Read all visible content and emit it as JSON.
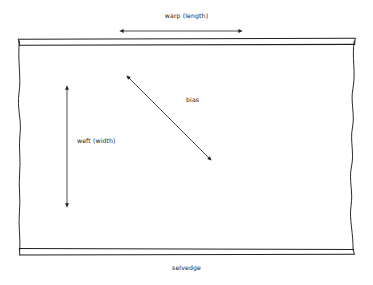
{
  "diagram": {
    "background_color": "#ffffff",
    "line_color": "#231f20",
    "labels": {
      "warp": "warp (length)",
      "weft": "weft (width)",
      "bias": "bias",
      "selvedge": "selvedge"
    },
    "annotations": [
      {
        "name": "warp-arrow",
        "label": "warp (length)",
        "orientation": "horizontal",
        "double_headed": true,
        "from": [
          122,
          31
        ],
        "to": [
          240,
          31
        ]
      },
      {
        "name": "weft-arrow",
        "label": "weft (width)",
        "orientation": "vertical",
        "double_headed": true,
        "from": [
          67,
          88
        ],
        "to": [
          67,
          205
        ]
      },
      {
        "name": "bias-arrow",
        "label": "bias",
        "orientation": "diagonal",
        "double_headed": true,
        "from": [
          128,
          77
        ],
        "to": [
          210,
          159
        ]
      }
    ],
    "fabric": {
      "top_selvedge_band": {
        "left": 18,
        "right": 355,
        "top": 39,
        "bottom": 45
      },
      "bottom_selvedge_band": {
        "left": 18,
        "right": 355,
        "top": 248,
        "bottom": 255
      },
      "left_edge": "wavy cut edge",
      "right_edge": "wavy cut edge"
    }
  }
}
